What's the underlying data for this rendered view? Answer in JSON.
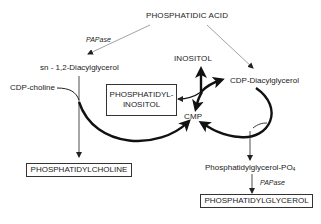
{
  "diagram": {
    "type": "biochemical-pathway",
    "nodes": {
      "phosphatidic_acid": "PHOSPHATIDIC ACID",
      "diacylglycerol": "sn - 1,2-Diacylglycerol",
      "cdp_choline": "CDP-choline",
      "inositol": "INOSITOL",
      "cdp_diacylglycerol": "CDP-Diacylglycerol",
      "phosphatidylinositol_line1": "PHOSPHATIDYL-",
      "phosphatidylinositol_line2": "INOSITOL",
      "cmp": "CMP",
      "phosphatidylcholine": "PHOSPHATIDYLCHOLINE",
      "phosphatidylglycerol_po4_main": "Phosphatidylglycerol-PO",
      "phosphatidylglycerol_po4_sub": "4",
      "phosphatidylglycerol": "PHOSPHATIDYLGLYCEROL"
    },
    "enzymes": {
      "papase_top": "PAPase",
      "papase_bottom": "PAPase"
    },
    "edges": [
      {
        "from": "PHOSPHATIDIC ACID",
        "to": "sn - 1,2-Diacylglycerol",
        "label": "PAPase"
      },
      {
        "from": "PHOSPHATIDIC ACID",
        "to": "CDP-Diacylglycerol"
      },
      {
        "from": "sn - 1,2-Diacylglycerol",
        "to": "PHOSPHATIDYLCHOLINE",
        "cofactor_in": "CDP-choline",
        "cofactor_out": "CMP"
      },
      {
        "from": "CDP-Diacylglycerol",
        "to": "PHOSPHATIDYL-INOSITOL",
        "cofactor_in": "INOSITOL",
        "cofactor_out": "CMP"
      },
      {
        "from": "CDP-Diacylglycerol",
        "to": "Phosphatidylglycerol-PO4",
        "cofactor_out": "CMP"
      },
      {
        "from": "Phosphatidylglycerol-PO4",
        "to": "PHOSPHATIDYLGLYCEROL",
        "label": "PAPase"
      }
    ],
    "colors": {
      "ink": "#222222",
      "thin_arrow": "#8a8a8a",
      "background": "#ffffff"
    }
  }
}
